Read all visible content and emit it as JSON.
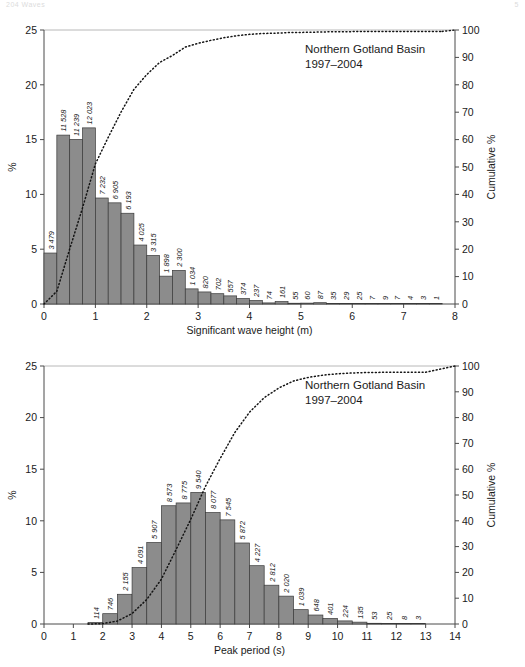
{
  "running_head": {
    "left": "204  Waves",
    "right": "5"
  },
  "chart_data": [
    {
      "id": "significant-wave-height",
      "type": "bar",
      "title": "Northern Gotland Basin",
      "subtitle": "1997–2004",
      "xlabel": "Significant wave height (m)",
      "ylabel": "%",
      "y2label": "Cumulative %",
      "xlim": [
        0,
        8
      ],
      "ylim": [
        0,
        25
      ],
      "y2lim": [
        0,
        100
      ],
      "xticks": [
        0,
        1,
        2,
        3,
        4,
        5,
        6,
        7,
        8
      ],
      "yticks": [
        0,
        5,
        10,
        15,
        20,
        25
      ],
      "y2ticks": [
        0,
        10,
        20,
        30,
        40,
        50,
        60,
        70,
        80,
        90,
        100
      ],
      "bin_width": 0.25,
      "bin_start": 0,
      "grid": false,
      "legend": "none",
      "counts": [
        3479,
        11528,
        11239,
        12023,
        7232,
        6905,
        6193,
        4025,
        3315,
        1898,
        2300,
        1034,
        820,
        702,
        557,
        374,
        237,
        74,
        161,
        55,
        60,
        87,
        35,
        29,
        25,
        7,
        9,
        7,
        4,
        3,
        1
      ],
      "count_labels": [
        "3 479",
        "11 528",
        "11 239",
        "12 023",
        "7 232",
        "6 905",
        "6 193",
        "4 025",
        "3 315",
        "1 898",
        "2 300",
        "1 034",
        "820",
        "702",
        "557",
        "374",
        "237",
        "74",
        "161",
        "55",
        "60",
        "87",
        "35",
        "29",
        "25",
        "7",
        "9",
        "7",
        "4",
        "3",
        "1"
      ],
      "percent_values": [
        4.65,
        15.41,
        15.02,
        16.07,
        9.67,
        9.23,
        8.28,
        5.38,
        4.43,
        2.54,
        3.07,
        1.38,
        1.1,
        0.94,
        0.74,
        0.5,
        0.32,
        0.1,
        0.22,
        0.07,
        0.08,
        0.12,
        0.05,
        0.04,
        0.03,
        0.01,
        0.01,
        0.01,
        0.01,
        0.0,
        0.0
      ],
      "cumulative_percent": [
        4.65,
        20.06,
        35.08,
        51.15,
        60.82,
        70.05,
        78.33,
        83.71,
        88.14,
        90.68,
        93.75,
        95.13,
        96.23,
        97.17,
        97.91,
        98.41,
        98.73,
        98.83,
        99.05,
        99.12,
        99.2,
        99.32,
        99.37,
        99.41,
        99.44,
        99.45,
        99.46,
        99.47,
        99.48,
        99.48,
        99.48
      ]
    },
    {
      "id": "peak-period",
      "type": "bar",
      "title": "Northern Gotland Basin",
      "subtitle": "1997–2004",
      "xlabel": "Peak period (s)",
      "ylabel": "%",
      "y2label": "Cumulative %",
      "xlim": [
        0,
        14
      ],
      "ylim": [
        0,
        25
      ],
      "y2lim": [
        0,
        100
      ],
      "xticks": [
        0,
        1,
        2,
        3,
        4,
        5,
        6,
        7,
        8,
        9,
        10,
        11,
        12,
        13,
        14
      ],
      "yticks": [
        0,
        5,
        10,
        15,
        20,
        25
      ],
      "y2ticks": [
        0,
        10,
        20,
        30,
        40,
        50,
        60,
        70,
        80,
        90,
        100
      ],
      "bin_width": 0.5,
      "bin_start": 1.5,
      "grid": false,
      "legend": "none",
      "counts": [
        114,
        746,
        2155,
        4091,
        5907,
        8573,
        8775,
        9540,
        8077,
        7545,
        5872,
        4227,
        2812,
        2020,
        1039,
        648,
        401,
        224,
        135,
        53,
        25,
        8,
        3
      ],
      "count_labels": [
        "114",
        "746",
        "2 155",
        "4 091",
        "5 907",
        "8 573",
        "8 775",
        "9 540",
        "8 077",
        "7 545",
        "5 872",
        "4 227",
        "2 812",
        "2 020",
        "1 039",
        "648",
        "401",
        "224",
        "135",
        "53",
        "25",
        "8",
        "3"
      ],
      "percent_values": [
        0.15,
        1.0,
        2.88,
        5.47,
        7.9,
        11.46,
        11.73,
        12.75,
        10.8,
        10.09,
        7.85,
        5.65,
        3.76,
        2.7,
        1.39,
        0.87,
        0.54,
        0.3,
        0.18,
        0.07,
        0.03,
        0.01,
        0.0
      ],
      "cumulative_percent": [
        0.15,
        1.15,
        4.03,
        9.5,
        17.4,
        28.86,
        40.59,
        53.34,
        64.14,
        74.23,
        82.08,
        87.73,
        91.49,
        94.19,
        95.58,
        96.45,
        96.99,
        97.29,
        97.47,
        97.54,
        97.57,
        97.58,
        97.58
      ]
    }
  ]
}
